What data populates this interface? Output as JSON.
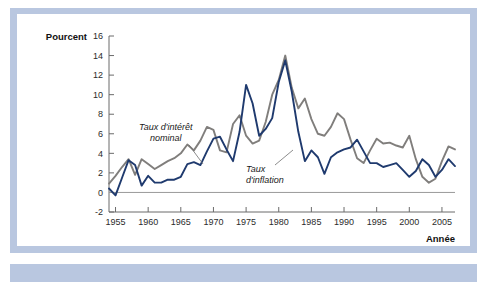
{
  "figure": {
    "y_axis_title": "Pourcent",
    "x_axis_title": "Année",
    "frame_color": "#b9c7e0",
    "background": "#ffffff"
  },
  "annotations": {
    "nominal": {
      "line1": "Taux d'intérêt",
      "line2": "nominal"
    },
    "inflation": {
      "line1": "Taux",
      "line2": "d'inflation"
    }
  },
  "yticks": [
    "16",
    "14",
    "12",
    "10",
    "8",
    "6",
    "4",
    "2",
    "0",
    "-2"
  ],
  "xticks": [
    "1955",
    "1960",
    "1965",
    "1970",
    "1975",
    "1980",
    "1985",
    "1990",
    "1995",
    "2000",
    "2005"
  ],
  "chart_data": {
    "type": "line",
    "title": "",
    "xlabel": "Année",
    "ylabel": "Pourcent",
    "xlim": [
      1954,
      2007
    ],
    "ylim": [
      -2,
      16
    ],
    "ytick_values": [
      -2,
      0,
      2,
      4,
      6,
      8,
      10,
      12,
      14,
      16
    ],
    "xtick_values": [
      1955,
      1960,
      1965,
      1970,
      1975,
      1980,
      1985,
      1990,
      1995,
      2000,
      2005
    ],
    "grid": false,
    "legend": "annotations-on-plot",
    "x": [
      1954,
      1955,
      1956,
      1957,
      1958,
      1959,
      1960,
      1961,
      1962,
      1963,
      1964,
      1965,
      1966,
      1967,
      1968,
      1969,
      1970,
      1971,
      1972,
      1973,
      1974,
      1975,
      1976,
      1977,
      1978,
      1979,
      1980,
      1981,
      1982,
      1983,
      1984,
      1985,
      1986,
      1987,
      1988,
      1989,
      1990,
      1991,
      1992,
      1993,
      1994,
      1995,
      1996,
      1997,
      1998,
      1999,
      2000,
      2001,
      2002,
      2003,
      2004,
      2005,
      2006,
      2007
    ],
    "series": [
      {
        "name": "Taux d'intérêt nominal",
        "color": "#807e7c",
        "values": [
          0.9,
          1.7,
          2.6,
          3.4,
          1.8,
          3.4,
          2.9,
          2.4,
          2.8,
          3.2,
          3.5,
          4.0,
          4.9,
          4.3,
          5.3,
          6.7,
          6.4,
          4.3,
          4.1,
          7.0,
          7.9,
          5.8,
          5.0,
          5.3,
          7.2,
          10.0,
          11.5,
          14.0,
          10.7,
          8.6,
          9.6,
          7.5,
          6.0,
          5.8,
          6.7,
          8.1,
          7.5,
          5.4,
          3.5,
          3.0,
          4.3,
          5.5,
          5.0,
          5.1,
          4.8,
          4.6,
          5.8,
          3.4,
          1.6,
          1.0,
          1.4,
          3.2,
          4.7,
          4.4
        ]
      },
      {
        "name": "Taux d'inflation",
        "color": "#1f3a6e",
        "values": [
          0.4,
          -0.3,
          1.5,
          3.3,
          2.8,
          0.7,
          1.7,
          1.0,
          1.0,
          1.3,
          1.3,
          1.6,
          2.9,
          3.1,
          2.8,
          4.2,
          5.5,
          5.7,
          4.4,
          3.2,
          6.2,
          11.0,
          9.1,
          5.8,
          6.5,
          7.6,
          11.3,
          13.5,
          10.3,
          6.2,
          3.2,
          4.3,
          3.6,
          1.9,
          3.6,
          4.1,
          4.4,
          4.6,
          5.4,
          4.2,
          3.0,
          3.0,
          2.6,
          2.8,
          3.0,
          2.3,
          1.6,
          2.2,
          3.4,
          2.8,
          1.6,
          2.3,
          3.4,
          2.7
        ]
      }
    ]
  }
}
